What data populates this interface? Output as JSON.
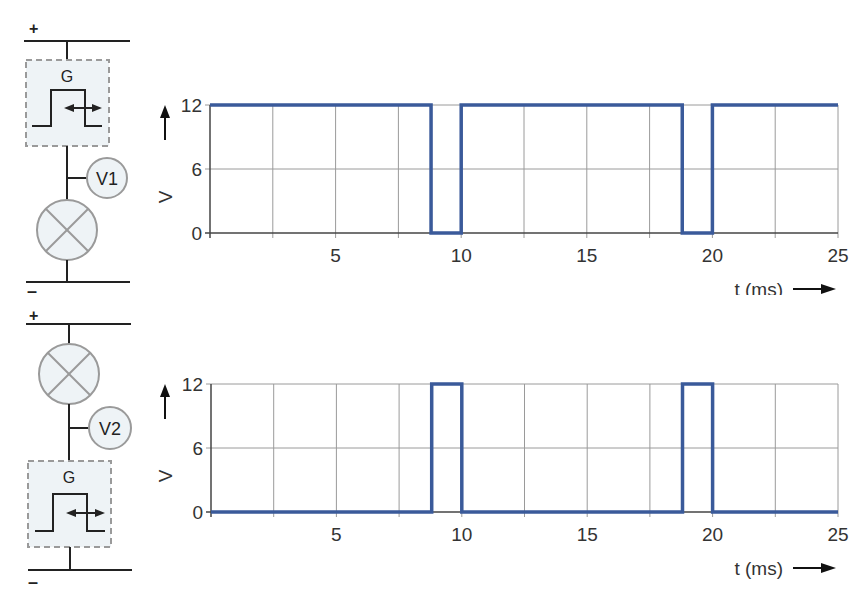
{
  "colors": {
    "signal": "#3a5a9a",
    "grid": "#9a9a9a",
    "axis": "#444444",
    "component_fill": "#eef3f6",
    "component_stroke": "#9a9a9a",
    "wire": "#222222"
  },
  "circuits": [
    {
      "plus_label": "+",
      "minus_label": "–",
      "generator_label": "G",
      "meter_label": "V1",
      "order": [
        "generator",
        "meter-node",
        "lamp"
      ]
    },
    {
      "plus_label": "+",
      "minus_label": "–",
      "generator_label": "G",
      "meter_label": "V2",
      "order": [
        "lamp",
        "meter-node",
        "generator"
      ]
    }
  ],
  "chart_data": [
    {
      "type": "line",
      "title": "V1",
      "xlabel": "t (ms)",
      "ylabel": "V",
      "xlim": [
        0,
        25
      ],
      "ylim": [
        0,
        12
      ],
      "xticks": [
        5,
        10,
        15,
        20,
        25
      ],
      "xtick_labels": [
        "5",
        "10",
        "15",
        "20",
        "25"
      ],
      "yticks": [
        0,
        6,
        12
      ],
      "ytick_labels": [
        "0",
        "6",
        "12"
      ],
      "grid": true,
      "x_grid_step": 2.5,
      "series": [
        {
          "name": "V1",
          "x": [
            0,
            8.8,
            8.8,
            10,
            10,
            18.8,
            18.8,
            20,
            20,
            25
          ],
          "y": [
            12,
            12,
            0,
            0,
            12,
            12,
            0,
            0,
            12,
            12
          ]
        }
      ]
    },
    {
      "type": "line",
      "title": "V2",
      "xlabel": "t (ms)",
      "ylabel": "V",
      "xlim": [
        0,
        25
      ],
      "ylim": [
        0,
        12
      ],
      "xticks": [
        5,
        10,
        15,
        20,
        25
      ],
      "xtick_labels": [
        "5",
        "10",
        "15",
        "20",
        "25"
      ],
      "yticks": [
        0,
        6,
        12
      ],
      "ytick_labels": [
        "0",
        "6",
        "12"
      ],
      "grid": true,
      "x_grid_step": 2.5,
      "series": [
        {
          "name": "V2",
          "x": [
            0,
            8.8,
            8.8,
            10,
            10,
            18.8,
            18.8,
            20,
            20,
            25
          ],
          "y": [
            0,
            0,
            12,
            12,
            0,
            0,
            12,
            12,
            0,
            0
          ]
        }
      ]
    }
  ]
}
